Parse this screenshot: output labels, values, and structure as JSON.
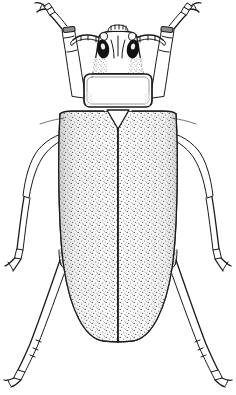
{
  "figure": {
    "domain": "natural-image",
    "view": "dorsal",
    "medium": "ink line drawing / stipple engraving",
    "caption": "",
    "title": "",
    "background_color": "#ffffff",
    "ink_color": "#1a1a1a",
    "eye_color": "#121212",
    "stipple_color": "#3a3a3a",
    "canvas": {
      "width": 236,
      "height": 395
    },
    "scan_artifact": {
      "present": true,
      "description": "faint cropped text remnants along top edge",
      "color": "#b9b9b9"
    },
    "parts": [
      {
        "name": "antenna-left",
        "label": "left antenna",
        "interactable": false
      },
      {
        "name": "antenna-right",
        "label": "right antenna",
        "interactable": false
      },
      {
        "name": "head",
        "label": "head",
        "interactable": false
      },
      {
        "name": "compound-eye-left",
        "label": "left compound eye",
        "interactable": false
      },
      {
        "name": "compound-eye-right",
        "label": "right compound eye",
        "interactable": false
      },
      {
        "name": "pronotum",
        "label": "pronotum",
        "interactable": false
      },
      {
        "name": "scutellum",
        "label": "scutellum",
        "interactable": false
      },
      {
        "name": "elytron-left",
        "label": "left elytron",
        "interactable": false
      },
      {
        "name": "elytron-right",
        "label": "right elytron",
        "interactable": false
      },
      {
        "name": "elytral-suture",
        "label": "elytral suture",
        "interactable": false
      },
      {
        "name": "foreleg-left",
        "label": "left foreleg",
        "interactable": false
      },
      {
        "name": "foreleg-right",
        "label": "right foreleg",
        "interactable": false
      },
      {
        "name": "midleg-left",
        "label": "left midleg",
        "interactable": false
      },
      {
        "name": "midleg-right",
        "label": "right midleg",
        "interactable": false
      },
      {
        "name": "hindleg-left",
        "label": "left hindleg",
        "interactable": false
      },
      {
        "name": "hindleg-right",
        "label": "right hindleg",
        "interactable": false
      },
      {
        "name": "tarsus-claw",
        "label": "tarsal claw",
        "interactable": false
      }
    ]
  }
}
